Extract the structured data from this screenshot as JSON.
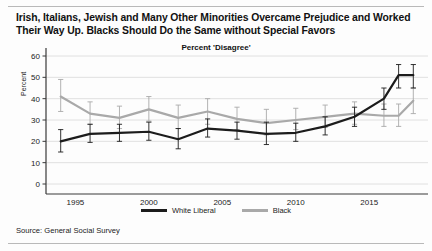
{
  "figure": {
    "title": "Irish, Italians, Jewish and Many Other Minorities Overcame Prejudice and Worked Their Way Up. Blacks Should Do the Same without Special Favors",
    "subtitle": "Percent 'Disagree'",
    "source": "Source: General Social Survey"
  },
  "legend": {
    "items": [
      {
        "label": "White Liberal",
        "color": "#1c1c1c"
      },
      {
        "label": "Black",
        "color": "#a9a9a9"
      }
    ]
  },
  "chart_data": {
    "type": "line",
    "title": "Irish, Italians, Jewish and Many Other Minorities Overcame Prejudice and Worked Their Way Up. Blacks Should Do the Same without Special Favors",
    "subtitle": "Percent 'Disagree'",
    "xlabel": "",
    "ylabel": "Percent",
    "ylim": [
      0,
      60
    ],
    "yticks": [
      0,
      10,
      20,
      30,
      40,
      50,
      60
    ],
    "xlim": [
      1993,
      2019
    ],
    "xticks": [
      1995,
      2000,
      2005,
      2010,
      2015
    ],
    "xtick_labels": [
      "1995",
      "2000",
      "2005",
      "2010",
      "2015"
    ],
    "grid": "horizontal",
    "legend_position": "bottom-center",
    "error_bars": true,
    "x": [
      1994,
      1996,
      1998,
      2000,
      2002,
      2004,
      2006,
      2008,
      2010,
      2012,
      2014,
      2016,
      2017,
      2018
    ],
    "series": [
      {
        "name": "White Liberal",
        "color": "#1c1c1c",
        "values": [
          20,
          23.5,
          24,
          24.5,
          21,
          26,
          25,
          23.5,
          24,
          27,
          31.5,
          40,
          51,
          51
        ],
        "err_low": [
          15,
          19.5,
          20,
          20.5,
          16.5,
          22,
          21,
          18.5,
          20,
          23,
          27,
          35,
          45,
          45
        ],
        "err_high": [
          25.5,
          28,
          28,
          29,
          26,
          30.5,
          29,
          29,
          28.5,
          31.5,
          36,
          45,
          56,
          56
        ]
      },
      {
        "name": "Black",
        "color": "#a9a9a9",
        "values": [
          41,
          33,
          31,
          35,
          31,
          34,
          30.5,
          28.5,
          30,
          31.5,
          33,
          32,
          32,
          39
        ],
        "err_low": [
          34,
          28,
          26,
          29.5,
          26,
          28,
          25.5,
          23,
          25.5,
          26.5,
          28,
          27,
          27,
          33
        ],
        "err_high": [
          49,
          38.5,
          36.5,
          41,
          37,
          40,
          36,
          35,
          35.5,
          37,
          38.5,
          37.5,
          37.5,
          45
        ]
      }
    ]
  }
}
